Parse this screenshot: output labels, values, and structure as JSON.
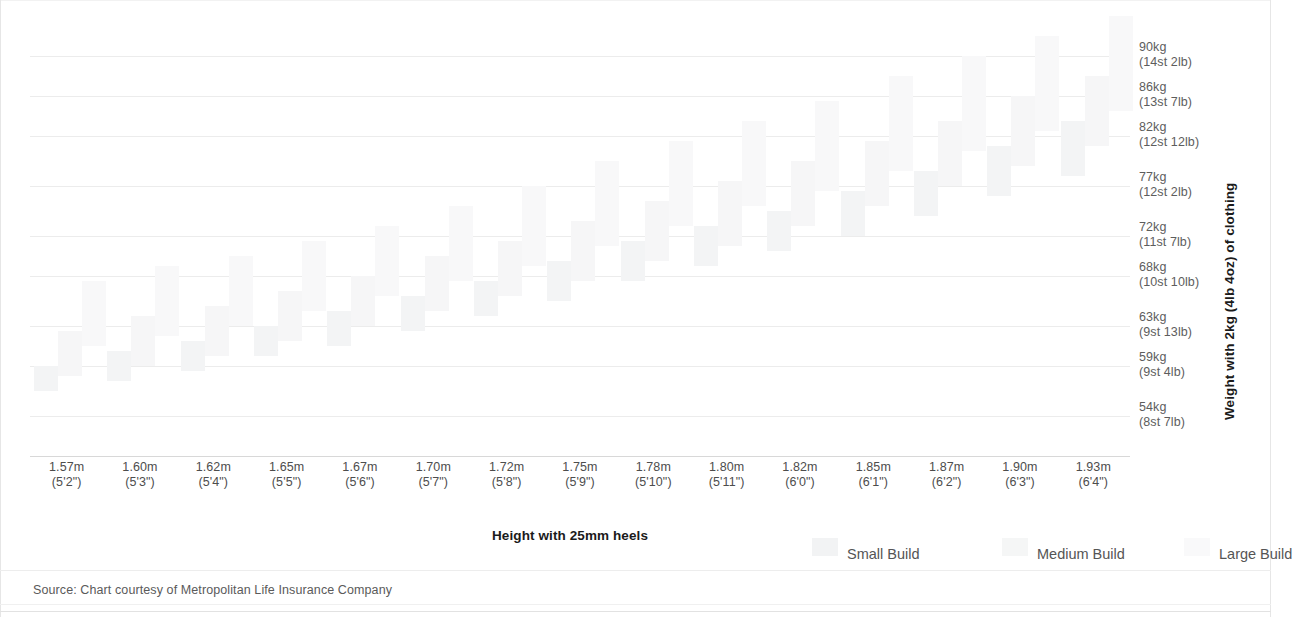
{
  "chart_data": {
    "type": "bar",
    "subtype": "grouped-floating-range-bar",
    "title": "",
    "xlabel": "Height with 25mm heels",
    "ylabel": "Weight with 2kg (4lb 4oz) of clothing",
    "ylim": [
      50,
      93
    ],
    "grid": true,
    "legend_position": "bottom-right",
    "source": "Source: Chart courtesy of Metropolitan Life Insurance Company",
    "y_ticks": [
      {
        "value": 90,
        "kg": "90kg",
        "imperial": "(14st 2lb)"
      },
      {
        "value": 86,
        "kg": "86kg",
        "imperial": "(13st 7lb)"
      },
      {
        "value": 82,
        "kg": "82kg",
        "imperial": "(12st 12lb)"
      },
      {
        "value": 77,
        "kg": "77kg",
        "imperial": "(12st 2lb)"
      },
      {
        "value": 72,
        "kg": "72kg",
        "imperial": "(11st 7lb)"
      },
      {
        "value": 68,
        "kg": "68kg",
        "imperial": "(10st 10lb)"
      },
      {
        "value": 63,
        "kg": "63kg",
        "imperial": "(9st 13lb)"
      },
      {
        "value": 59,
        "kg": "59kg",
        "imperial": "(9st 4lb)"
      },
      {
        "value": 54,
        "kg": "54kg",
        "imperial": "(8st 7lb)"
      }
    ],
    "categories": [
      {
        "metric": "1.57m",
        "imperial": "(5'2\")"
      },
      {
        "metric": "1.60m",
        "imperial": "(5'3\")"
      },
      {
        "metric": "1.62m",
        "imperial": "(5'4\")"
      },
      {
        "metric": "1.65m",
        "imperial": "(5'5\")"
      },
      {
        "metric": "1.67m",
        "imperial": "(5'6\")"
      },
      {
        "metric": "1.70m",
        "imperial": "(5'7\")"
      },
      {
        "metric": "1.72m",
        "imperial": "(5'8\")"
      },
      {
        "metric": "1.75m",
        "imperial": "(5'9\")"
      },
      {
        "metric": "1.78m",
        "imperial": "(5'10\")"
      },
      {
        "metric": "1.80m",
        "imperial": "(5'11\")"
      },
      {
        "metric": "1.82m",
        "imperial": "(6'0\")"
      },
      {
        "metric": "1.85m",
        "imperial": "(6'1\")"
      },
      {
        "metric": "1.87m",
        "imperial": "(6'2\")"
      },
      {
        "metric": "1.90m",
        "imperial": "(6'3\")"
      },
      {
        "metric": "1.93m",
        "imperial": "(6'4\")"
      }
    ],
    "series": [
      {
        "name": "Small Build",
        "color": "#f3f4f5",
        "ranges": [
          [
            56.5,
            59.0
          ],
          [
            57.5,
            60.5
          ],
          [
            58.5,
            61.5
          ],
          [
            60.0,
            63.0
          ],
          [
            61.0,
            64.5
          ],
          [
            62.5,
            66.0
          ],
          [
            64.0,
            67.5
          ],
          [
            65.5,
            69.5
          ],
          [
            67.5,
            71.5
          ],
          [
            69.0,
            73.0
          ],
          [
            70.5,
            74.5
          ],
          [
            72.0,
            76.5
          ],
          [
            74.0,
            78.5
          ],
          [
            76.0,
            81.0
          ],
          [
            78.0,
            83.5
          ]
        ]
      },
      {
        "name": "Medium Build",
        "color": "#f6f6f7",
        "ranges": [
          [
            58.0,
            62.5
          ],
          [
            59.0,
            64.0
          ],
          [
            60.0,
            65.0
          ],
          [
            61.5,
            66.5
          ],
          [
            63.0,
            68.0
          ],
          [
            64.5,
            70.0
          ],
          [
            66.0,
            71.5
          ],
          [
            67.5,
            73.5
          ],
          [
            69.5,
            75.5
          ],
          [
            71.0,
            77.5
          ],
          [
            73.0,
            79.5
          ],
          [
            75.0,
            81.5
          ],
          [
            77.0,
            83.5
          ],
          [
            79.0,
            86.0
          ],
          [
            81.0,
            88.0
          ]
        ]
      },
      {
        "name": "Large Build",
        "color": "#f8f8f9",
        "ranges": [
          [
            61.0,
            67.5
          ],
          [
            62.0,
            69.0
          ],
          [
            63.0,
            70.0
          ],
          [
            64.5,
            71.5
          ],
          [
            66.0,
            73.0
          ],
          [
            67.5,
            75.0
          ],
          [
            69.0,
            77.0
          ],
          [
            71.0,
            79.5
          ],
          [
            73.0,
            81.5
          ],
          [
            75.0,
            83.5
          ],
          [
            76.5,
            85.5
          ],
          [
            78.5,
            88.0
          ],
          [
            80.5,
            90.0
          ],
          [
            82.5,
            92.0
          ],
          [
            84.5,
            94.0
          ]
        ]
      }
    ]
  },
  "legend": {
    "items": [
      {
        "label": "Small Build",
        "key": "small"
      },
      {
        "label": "Medium Build",
        "key": "medium"
      },
      {
        "label": "Large Build",
        "key": "large"
      }
    ]
  },
  "axes": {
    "x_title": "Height with 25mm heels",
    "y_title": "Weight with 2kg (4lb 4oz) of clothing"
  },
  "footer": {
    "source": "Source: Chart courtesy of Metropolitan Life Insurance Company"
  }
}
